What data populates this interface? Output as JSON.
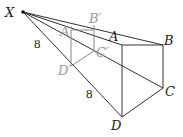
{
  "diagram": {
    "type": "projection / similar figures",
    "labels": {
      "X": "X",
      "A": "A",
      "B": "B",
      "C": "C",
      "D": "D",
      "A_prime": "A′",
      "B_prime": "B′",
      "C_prime": "C′",
      "D_prime": "D′",
      "len_XD_prime": "8",
      "len_D_primeD": "8"
    },
    "colors": {
      "dark": "#222222",
      "light": "#999999"
    }
  }
}
